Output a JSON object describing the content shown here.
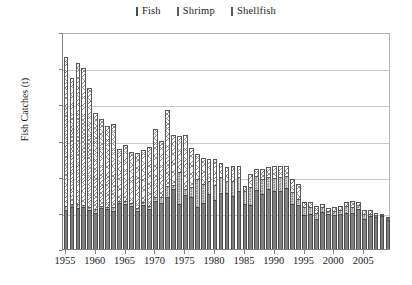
{
  "chart_data": {
    "type": "bar",
    "subtype": "stacked-bar",
    "title": "",
    "xlabel": "",
    "ylabel": "Fish Catches (t)",
    "ylim": [
      0,
      12000
    ],
    "ytick_step": 2000,
    "ytick_labels": [
      "0",
      "2,000",
      "4,000",
      "6,000",
      "8,000",
      "10,000",
      "12,000"
    ],
    "ytick_values": [
      0,
      2000,
      4000,
      6000,
      8000,
      10000,
      12000
    ],
    "grid": "horizontal",
    "legend_position": "top-center",
    "xtick_labels": [
      "1955",
      "1960",
      "1965",
      "1970",
      "1975",
      "1980",
      "1985",
      "1990",
      "1995",
      "2000",
      "2005"
    ],
    "xtick_values": [
      1955,
      1960,
      1965,
      1970,
      1975,
      1980,
      1985,
      1990,
      1995,
      2000,
      2005
    ],
    "x": [
      1955,
      1956,
      1957,
      1958,
      1959,
      1960,
      1961,
      1962,
      1963,
      1964,
      1965,
      1966,
      1967,
      1968,
      1969,
      1970,
      1971,
      1972,
      1973,
      1974,
      1975,
      1976,
      1977,
      1978,
      1979,
      1980,
      1981,
      1982,
      1983,
      1984,
      1985,
      1986,
      1987,
      1988,
      1989,
      1990,
      1991,
      1992,
      1993,
      1994,
      1995,
      1996,
      1997,
      1998,
      1999,
      2000,
      2001,
      2002,
      2003,
      2004,
      2005,
      2006,
      2007,
      2008,
      2009
    ],
    "series": [
      {
        "name": "Fish",
        "color": "#808080",
        "pattern": "solid",
        "values": [
          2150,
          2350,
          2250,
          2300,
          2150,
          2000,
          2250,
          2200,
          2100,
          2550,
          2500,
          2400,
          2100,
          2450,
          2200,
          2650,
          2550,
          2900,
          3300,
          2500,
          3000,
          2900,
          2350,
          2550,
          3050,
          2700,
          3100,
          3100,
          2950,
          3200,
          2500,
          2450,
          3250,
          3050,
          3300,
          3200,
          3200,
          3350,
          2500,
          2450,
          1900,
          1950,
          1650,
          2050,
          1950,
          1900,
          1950,
          2000,
          2000,
          2200,
          1650,
          1800,
          1750,
          1800,
          1600
        ]
      },
      {
        "name": "Shrimp",
        "color": "#d7d7d7",
        "pattern": "dotted",
        "values": [
          250,
          150,
          250,
          150,
          150,
          200,
          150,
          150,
          200,
          100,
          150,
          150,
          150,
          150,
          200,
          250,
          350,
          600,
          250,
          1750,
          300,
          550,
          1500,
          1050,
          700,
          850,
          900,
          650,
          800,
          800,
          700,
          1000,
          800,
          850,
          700,
          750,
          800,
          700,
          650,
          300,
          400,
          400,
          350,
          250,
          150,
          200,
          200,
          400,
          300,
          250,
          300,
          150,
          150,
          100,
          100
        ]
      },
      {
        "name": "Shellfish",
        "color": "#ffffff",
        "pattern": "hatched",
        "values": [
          8200,
          6950,
          7800,
          7550,
          6600,
          5300,
          4800,
          4450,
          4600,
          2900,
          3100,
          2800,
          3050,
          2900,
          3250,
          3750,
          3100,
          4200,
          2750,
          2000,
          3000,
          2150,
          1400,
          1450,
          1250,
          1450,
          750,
          800,
          850,
          600,
          300,
          700,
          400,
          550,
          550,
          650,
          600,
          550,
          700,
          850,
          300,
          250,
          400,
          200,
          150,
          200,
          250,
          200,
          350,
          150,
          200,
          200,
          100,
          50,
          50
        ]
      }
    ],
    "totals": [
      10600,
      9450,
      10300,
      10000,
      8900,
      7500,
      7200,
      6800,
      6900,
      5550,
      5750,
      5350,
      5300,
      5500,
      5650,
      6650,
      6000,
      7700,
      6300,
      6250,
      6300,
      5600,
      5250,
      5050,
      5000,
      5000,
      4750,
      4550,
      4600,
      4600,
      3500,
      4150,
      4450,
      4450,
      4550,
      4600,
      4600,
      4600,
      3850,
      3600,
      2600,
      2600,
      2400,
      2500,
      2250,
      2300,
      2400,
      2600,
      2650,
      2600,
      2150,
      2150,
      2000,
      1950,
      1750
    ]
  },
  "legend": {
    "items": [
      {
        "label": "Fish"
      },
      {
        "label": "Shrimp"
      },
      {
        "label": "Shellfish"
      }
    ]
  },
  "axes": {
    "y_title": "Fish Catches (t)"
  }
}
